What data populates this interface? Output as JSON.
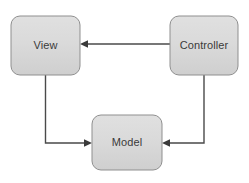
{
  "diagram": {
    "type": "flow-diagram",
    "canvas": {
      "width": 249,
      "height": 183,
      "background": "#ffffff"
    },
    "style": {
      "node_fill_top": "#dcdcdc",
      "node_fill_bottom": "#d2d2d2",
      "node_stroke": "#8f8f8f",
      "node_radius": 9,
      "edge_color": "#4a4a4a",
      "label_color": "#3a3a3a"
    },
    "nodes": [
      {
        "id": "view",
        "label": "View",
        "x": 11,
        "y": 16,
        "width": 69,
        "height": 59,
        "label_x": 45.5,
        "label_y": 46
      },
      {
        "id": "controller",
        "label": "Controller",
        "x": 170,
        "y": 16,
        "width": 68,
        "height": 59,
        "label_x": 204,
        "label_y": 46
      },
      {
        "id": "model",
        "label": "Model",
        "x": 92,
        "y": 115,
        "width": 70,
        "height": 55,
        "label_x": 127,
        "label_y": 143
      }
    ],
    "edges": [
      {
        "id": "controller-to-view",
        "from": "controller",
        "to": "view",
        "direction": "left",
        "path": "M 170 44 L 84 44",
        "arrow_points": "80,44 88,40.2 88,47.8"
      },
      {
        "id": "view-to-model",
        "from": "view",
        "to": "model",
        "direction": "right",
        "path": "M 45.5 75 L 45.5 143 L 88 143",
        "arrow_points": "92,143 84,139.2 84,146.8"
      },
      {
        "id": "controller-to-model",
        "from": "controller",
        "to": "model",
        "direction": "left",
        "path": "M 204 75 L 204 143 L 166 143",
        "arrow_points": "162,143 170,139.2 170,146.8"
      }
    ]
  }
}
